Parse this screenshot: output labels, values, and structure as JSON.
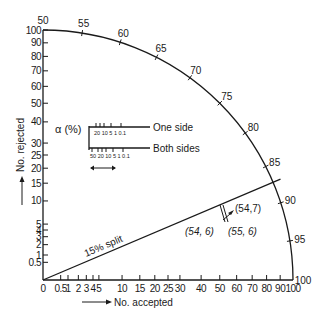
{
  "chart_data": {
    "type": "binomial-probability-paper",
    "title": "",
    "xlabel": "No. accepted",
    "ylabel": "No. rejected",
    "x_scale": "square-root",
    "y_scale": "square-root",
    "xlim": [
      0,
      100
    ],
    "ylim": [
      0,
      100
    ],
    "x_ticks": [
      "0",
      "0.5",
      "1",
      "2",
      "3",
      "4",
      "5",
      "10",
      "15",
      "20",
      "25",
      "30",
      "40",
      "50",
      "60",
      "70",
      "80",
      "90",
      "100"
    ],
    "x_tick_values": [
      0,
      0.5,
      1,
      2,
      3,
      4,
      5,
      10,
      15,
      20,
      25,
      30,
      40,
      50,
      60,
      70,
      80,
      90,
      100
    ],
    "y_ticks": [
      "0.5",
      "1",
      "2",
      "3",
      "4",
      "5",
      "10",
      "15",
      "20",
      "25",
      "30",
      "40",
      "50",
      "60",
      "70",
      "80",
      "90",
      "100"
    ],
    "y_tick_values": [
      0.5,
      1,
      2,
      3,
      4,
      5,
      10,
      15,
      20,
      25,
      30,
      40,
      50,
      60,
      70,
      80,
      90,
      100
    ],
    "arc_ticks": [
      "50",
      "55",
      "60",
      "65",
      "70",
      "75",
      "80",
      "85",
      "90",
      "95",
      "100"
    ],
    "arc_tick_values": [
      50,
      55,
      60,
      65,
      70,
      75,
      80,
      85,
      90,
      95,
      100
    ],
    "split_line": {
      "label": "15% split",
      "percent": 15
    },
    "points": [
      {
        "label": "(54,7)",
        "x": 54,
        "y": 7
      },
      {
        "label": "(54, 6)",
        "x": 54,
        "y": 6
      },
      {
        "label": "(55, 6)",
        "x": 55,
        "y": 6
      }
    ],
    "alpha_scale": {
      "label": "α (%)",
      "one_side": {
        "label": "One side",
        "ticks": [
          "20",
          "10",
          "5",
          "1",
          "0.1"
        ]
      },
      "both_sides": {
        "label": "Both sides",
        "ticks": [
          "50",
          "20",
          "10",
          "5",
          "1",
          "0.1"
        ]
      }
    },
    "grid": false,
    "legend": "none"
  },
  "labels": {
    "x_axis": "No. accepted",
    "y_axis": "No. rejected",
    "split": "15% split",
    "alpha": "α (%)",
    "one_side": "One side",
    "both_sides": "Both sides",
    "pt1": "(54,7)",
    "pt2": "(54, 6)",
    "pt3": "(55, 6)",
    "one_side_ticks": "20 10 5  1   0.1",
    "both_sides_ticks": "50 20 10 5  1   0.1"
  }
}
